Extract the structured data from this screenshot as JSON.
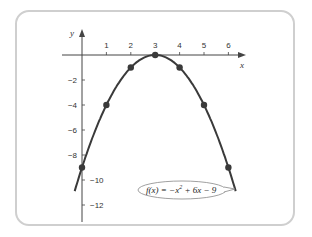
{
  "chart_data": {
    "type": "line",
    "title": "",
    "function_label": "f(x) = −x² + 6x − 9",
    "function_label_parts": {
      "lhs": "f(x) = −x",
      "exp": "2",
      "rhs": " + 6x − 9"
    },
    "xlabel": "x",
    "ylabel": "y",
    "xlim": [
      -0.3,
      6.8
    ],
    "ylim": [
      -13,
      1.5
    ],
    "x_ticks": [
      1,
      2,
      3,
      4,
      5,
      6
    ],
    "x_tick_labels": [
      "1",
      "2",
      "3",
      "4",
      "5",
      "6"
    ],
    "y_ticks": [
      -2,
      -4,
      -6,
      -8,
      -10,
      -12
    ],
    "y_tick_labels": [
      "−2",
      "−4",
      "−6",
      "−8",
      "−10",
      "−12"
    ],
    "points": [
      {
        "x": 0,
        "y": -9
      },
      {
        "x": 1,
        "y": -4
      },
      {
        "x": 2,
        "y": -1
      },
      {
        "x": 3,
        "y": 0
      },
      {
        "x": 4,
        "y": -1
      },
      {
        "x": 5,
        "y": -4
      },
      {
        "x": 6,
        "y": -9
      }
    ],
    "curve_domain": [
      -0.3,
      6.3
    ],
    "grid": false,
    "colors": {
      "curve": "#3a3a3a",
      "axis": "#444444",
      "frame": "#cfcfcf",
      "point": "#3a3a3a"
    }
  }
}
